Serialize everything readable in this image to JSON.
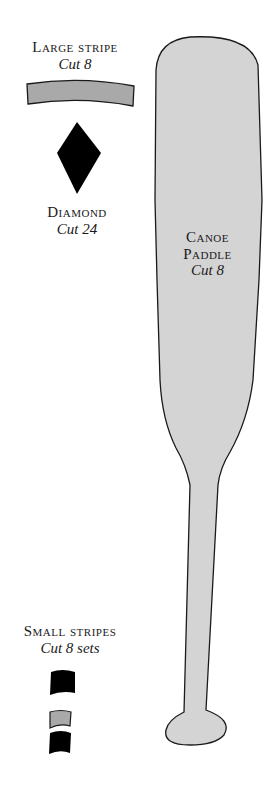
{
  "pattern": {
    "pieces": [
      {
        "id": "large-stripe",
        "name": "Large stripe",
        "cut": "Cut 8",
        "fill": "#a9a9a9"
      },
      {
        "id": "diamond",
        "name": "Diamond",
        "cut": "Cut 24",
        "fill": "#000000"
      },
      {
        "id": "canoe-paddle",
        "name_line1": "Canoe",
        "name_line2": "Paddle",
        "cut": "Cut 8",
        "fill": "#d4d4d4"
      },
      {
        "id": "small-stripes",
        "name": "Small stripes",
        "cut": "Cut 8 sets",
        "fills": [
          "#000000",
          "#a9a9a9",
          "#000000"
        ]
      }
    ]
  }
}
